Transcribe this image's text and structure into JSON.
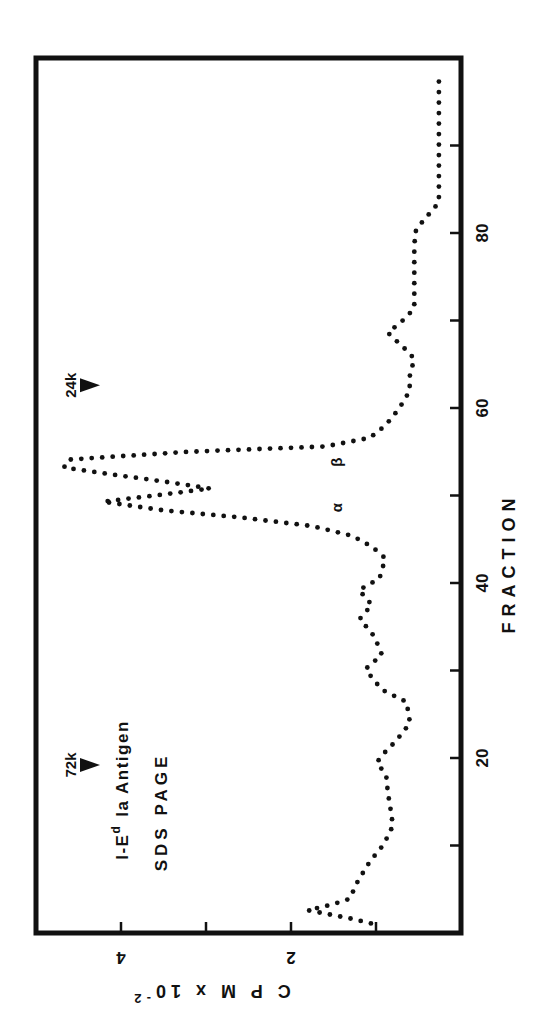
{
  "chart_data": {
    "type": "line",
    "style": "dotted",
    "orientation": "rotated 90° counter-clockwise (fraction axis runs bottom-to-top on right side, CPM increases leftward)",
    "title_line1": "I-E",
    "title_superscript": "d",
    "title_line1_rest": "Ia Antigen",
    "title_line2": "SDS  PAGE",
    "xlabel": "FRACTION",
    "ylabel": "C P M x 10",
    "ylabel_superscript": "-2",
    "x_ticks": [
      10,
      20,
      30,
      40,
      50,
      60,
      70,
      80,
      90
    ],
    "x_tick_labels": [
      "20",
      "40",
      "60",
      "80"
    ],
    "y_ticks": [
      1,
      2,
      3,
      4
    ],
    "y_tick_labels": [
      "2",
      "4"
    ],
    "xlim": [
      0,
      100
    ],
    "ylim": [
      0,
      5
    ],
    "grid": false,
    "markers": [
      {
        "label": "72k",
        "fraction": 19.2
      },
      {
        "label": "24k",
        "fraction": 62.6
      }
    ],
    "annotations": [
      {
        "text": "α",
        "fraction": 48.6,
        "cpm": 1.5
      },
      {
        "text": "β",
        "fraction": 53.8,
        "cpm": 1.5
      }
    ],
    "series": [
      {
        "name": "I-Ed Ia Antigen",
        "x": [
          1.1,
          1.7,
          2.6,
          3.2,
          3.9,
          6.0,
          8.2,
          10.1,
          12.3,
          14.2,
          16.0,
          18.0,
          19.5,
          20.6,
          22.0,
          24.0,
          26.4,
          27.8,
          29.2,
          30.2,
          31.8,
          33.9,
          35.9,
          37.5,
          39.2,
          40.5,
          42.8,
          44.1,
          45.4,
          46.5,
          47.5,
          48.3,
          49.3,
          50.0,
          50.8,
          51.6,
          52.4,
          53.2,
          54.1,
          55.0,
          55.6,
          56.6,
          58.0,
          59.9,
          62.0,
          63.4,
          65.6,
          66.4,
          68.6,
          70.2,
          71.4,
          74.0,
          77.6,
          80.1,
          81.1,
          82.0,
          83.5,
          86.0,
          90.0,
          94.0,
          97.9
        ],
        "y": [
          1.06,
          1.32,
          1.8,
          1.54,
          1.31,
          1.21,
          1.07,
          0.91,
          0.8,
          0.83,
          0.86,
          0.88,
          0.99,
          0.9,
          0.76,
          0.6,
          0.64,
          0.93,
          1.05,
          1.12,
          0.93,
          1.02,
          1.19,
          1.05,
          1.2,
          0.96,
          0.89,
          1.04,
          1.28,
          1.75,
          2.6,
          3.5,
          4.21,
          3.6,
          2.95,
          3.5,
          4.1,
          4.67,
          4.62,
          3.2,
          1.6,
          1.07,
          0.89,
          0.73,
          0.6,
          0.61,
          0.55,
          0.62,
          0.86,
          0.66,
          0.55,
          0.55,
          0.55,
          0.54,
          0.47,
          0.39,
          0.26,
          0.26,
          0.26,
          0.26,
          0.26
        ]
      }
    ]
  }
}
